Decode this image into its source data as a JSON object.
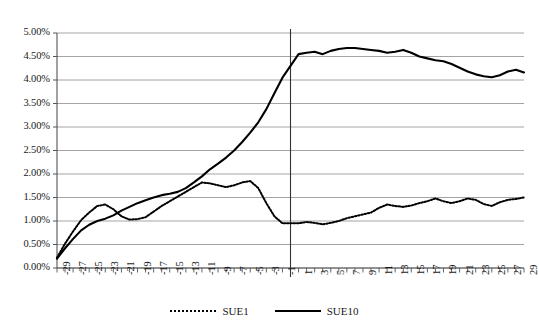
{
  "chart_data": {
    "type": "line",
    "title": "",
    "xlabel": "",
    "ylabel": "",
    "ylim": [
      0,
      5
    ],
    "xlim": [
      -29,
      29
    ],
    "ytick_format": "percent",
    "ytick_labels": [
      "0.00%",
      "0.50%",
      "1.00%",
      "1.50%",
      "2.00%",
      "2.50%",
      "3.00%",
      "3.50%",
      "4.00%",
      "4.50%",
      "5.00%"
    ],
    "ytick_values": [
      0,
      0.5,
      1.0,
      1.5,
      2.0,
      2.5,
      3.0,
      3.5,
      4.0,
      4.5,
      5.0
    ],
    "xtick_labels": [
      "-29",
      "-27",
      "-25",
      "-23",
      "-21",
      "-19",
      "-17",
      "-15",
      "-13",
      "-11",
      "-9",
      "-7",
      "-5",
      "-3",
      "-1",
      "1",
      "3",
      "5",
      "7",
      "9",
      "11",
      "13",
      "15",
      "17",
      "19",
      "21",
      "23",
      "25",
      "27",
      "29"
    ],
    "xtick_values": [
      -29,
      -27,
      -25,
      -23,
      -21,
      -19,
      -17,
      -15,
      -13,
      -11,
      -9,
      -7,
      -5,
      -3,
      -1,
      1,
      3,
      5,
      7,
      9,
      11,
      13,
      15,
      17,
      19,
      21,
      23,
      25,
      27,
      29
    ],
    "grid": "horizontal",
    "legend_position": "bottom",
    "reference_line_x": 0,
    "x": [
      -29,
      -28,
      -27,
      -26,
      -25,
      -24,
      -23,
      -22,
      -21,
      -20,
      -19,
      -18,
      -17,
      -16,
      -15,
      -14,
      -13,
      -12,
      -11,
      -10,
      -9,
      -8,
      -7,
      -6,
      -5,
      -4,
      -3,
      -2,
      -1,
      1,
      2,
      3,
      4,
      5,
      6,
      7,
      8,
      9,
      10,
      11,
      12,
      13,
      14,
      15,
      16,
      17,
      18,
      19,
      20,
      21,
      22,
      23,
      24,
      25,
      26,
      27,
      28,
      29
    ],
    "series": [
      {
        "name": "SUE1",
        "style": "dotted",
        "color": "#000000",
        "values": [
          0.22,
          0.52,
          0.78,
          1.02,
          1.18,
          1.32,
          1.35,
          1.25,
          1.1,
          1.03,
          1.04,
          1.08,
          1.2,
          1.32,
          1.42,
          1.52,
          1.62,
          1.72,
          1.82,
          1.8,
          1.76,
          1.72,
          1.76,
          1.82,
          1.85,
          1.7,
          1.38,
          1.1,
          0.95,
          0.95,
          0.98,
          0.96,
          0.93,
          0.96,
          1.0,
          1.06,
          1.1,
          1.14,
          1.18,
          1.28,
          1.35,
          1.32,
          1.3,
          1.33,
          1.38,
          1.42,
          1.48,
          1.42,
          1.38,
          1.42,
          1.48,
          1.45,
          1.36,
          1.32,
          1.4,
          1.45,
          1.47,
          1.5
        ]
      },
      {
        "name": "SUE10",
        "style": "solid",
        "color": "#000000",
        "values": [
          0.2,
          0.42,
          0.62,
          0.8,
          0.92,
          1.0,
          1.05,
          1.12,
          1.22,
          1.3,
          1.38,
          1.44,
          1.5,
          1.55,
          1.58,
          1.62,
          1.7,
          1.82,
          1.95,
          2.1,
          2.22,
          2.35,
          2.5,
          2.68,
          2.88,
          3.1,
          3.38,
          3.72,
          4.05,
          4.55,
          4.58,
          4.6,
          4.55,
          4.62,
          4.66,
          4.68,
          4.68,
          4.66,
          4.64,
          4.62,
          4.58,
          4.6,
          4.64,
          4.58,
          4.5,
          4.46,
          4.42,
          4.4,
          4.34,
          4.26,
          4.18,
          4.12,
          4.08,
          4.06,
          4.1,
          4.18,
          4.22,
          4.16
        ]
      }
    ]
  },
  "legend": {
    "items": [
      {
        "label": "SUE1",
        "style": "dotted"
      },
      {
        "label": "SUE10",
        "style": "solid"
      }
    ]
  },
  "axis_colors": {
    "grid": "#9a9a9a",
    "axis": "#555555",
    "line": "#000000"
  }
}
